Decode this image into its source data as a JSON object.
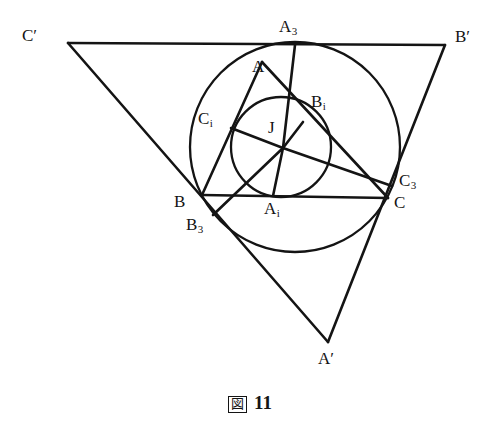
{
  "figure": {
    "caption_glyph": "図",
    "caption_number": "11",
    "stroke_color": "#141414",
    "background_color": "#ffffff",
    "width": 500,
    "height": 426
  },
  "labels": {
    "C_prime": "C′",
    "A3": "A₃",
    "B_prime": "B′",
    "A": "A",
    "Bi": "Bᵢ",
    "Ci": "Cᵢ",
    "J": "J",
    "C3": "C₃",
    "B": "B",
    "Ai": "Aᵢ",
    "C": "C",
    "B3": "B₃",
    "A_prime": "A′"
  },
  "geometry": {
    "points": {
      "A": {
        "x": 262,
        "y": 62,
        "label": "A"
      },
      "B": {
        "x": 202,
        "y": 195,
        "label": "B"
      },
      "C": {
        "x": 388,
        "y": 198,
        "label": "C"
      },
      "A_prime": {
        "x": 328,
        "y": 342,
        "label": "A′"
      },
      "B_prime": {
        "x": 445,
        "y": 45,
        "label": "B′"
      },
      "C_prime": {
        "x": 68,
        "y": 43,
        "label": "C′"
      },
      "A3": {
        "x": 295,
        "y": 45,
        "label": "A₃"
      },
      "B3": {
        "x": 213,
        "y": 215,
        "label": "B₃"
      },
      "C3": {
        "x": 392,
        "y": 186,
        "label": "C₃"
      },
      "Ai": {
        "x": 273,
        "y": 196,
        "label": "Aᵢ"
      },
      "Bi": {
        "x": 303,
        "y": 122,
        "label": "Bᵢ"
      },
      "Ci": {
        "x": 231,
        "y": 128,
        "label": "Cᵢ"
      },
      "J": {
        "x": 283,
        "y": 148,
        "label": "J"
      }
    },
    "circles": [
      {
        "name": "outer-circle",
        "cx": 295,
        "cy": 147,
        "r": 105
      },
      {
        "name": "incircle",
        "cx": 281,
        "cy": 147,
        "r": 50
      }
    ],
    "segments": [
      {
        "name": "side-B-prime-C-prime",
        "from": "C_prime",
        "to": "B_prime"
      },
      {
        "name": "side-C-prime-A-prime",
        "from": "C_prime",
        "to": "A_prime"
      },
      {
        "name": "side-A-prime-B-prime",
        "from": "A_prime",
        "to": "B_prime"
      },
      {
        "name": "side-AB",
        "from": "A",
        "to": "B"
      },
      {
        "name": "side-BC",
        "from": "B",
        "to": "C"
      },
      {
        "name": "side-CA",
        "from": "C",
        "to": "A"
      },
      {
        "name": "cevian-J-A3",
        "from": "J",
        "to": "A3"
      },
      {
        "name": "cevian-J-B3",
        "from": "J",
        "to": "B3"
      },
      {
        "name": "cevian-J-C3",
        "from": "J",
        "to": "C3"
      },
      {
        "name": "inradius-J-Ai",
        "from": "J",
        "to": "Ai"
      },
      {
        "name": "inradius-J-Bi",
        "from": "J",
        "to": "Bi"
      },
      {
        "name": "inradius-J-Ci",
        "from": "J",
        "to": "Ci"
      }
    ]
  },
  "label_positions": [
    {
      "key": "C_prime",
      "name": "point-label-c-prime",
      "x": 22,
      "y": 27,
      "text": "C",
      "sub": "",
      "prime": true
    },
    {
      "key": "A3",
      "name": "point-label-a3",
      "x": 279,
      "y": 18,
      "text": "A",
      "sub": "3",
      "prime": false
    },
    {
      "key": "B_prime",
      "name": "point-label-b-prime",
      "x": 455,
      "y": 28,
      "text": "B",
      "sub": "",
      "prime": true
    },
    {
      "key": "A",
      "name": "point-label-a",
      "x": 252,
      "y": 58,
      "text": "A",
      "sub": "",
      "prime": false
    },
    {
      "key": "Bi",
      "name": "point-label-bi",
      "x": 311,
      "y": 93,
      "text": "B",
      "sub": "i",
      "prime": false
    },
    {
      "key": "Ci",
      "name": "point-label-ci",
      "x": 198,
      "y": 110,
      "text": "C",
      "sub": "i",
      "prime": false
    },
    {
      "key": "J",
      "name": "point-label-j",
      "x": 268,
      "y": 119,
      "text": "J",
      "sub": "",
      "prime": false
    },
    {
      "key": "C3",
      "name": "point-label-c3",
      "x": 399,
      "y": 172,
      "text": "C",
      "sub": "3",
      "prime": false
    },
    {
      "key": "B",
      "name": "point-label-b",
      "x": 174,
      "y": 193,
      "text": "B",
      "sub": "",
      "prime": false
    },
    {
      "key": "Ai",
      "name": "point-label-ai",
      "x": 264,
      "y": 200,
      "text": "A",
      "sub": "i",
      "prime": false
    },
    {
      "key": "C",
      "name": "point-label-c",
      "x": 394,
      "y": 194,
      "text": "C",
      "sub": "",
      "prime": false
    },
    {
      "key": "B3",
      "name": "point-label-b3",
      "x": 186,
      "y": 216,
      "text": "B",
      "sub": "3",
      "prime": false
    },
    {
      "key": "A_prime",
      "name": "point-label-a-prime",
      "x": 318,
      "y": 350,
      "text": "A",
      "sub": "",
      "prime": true
    }
  ]
}
